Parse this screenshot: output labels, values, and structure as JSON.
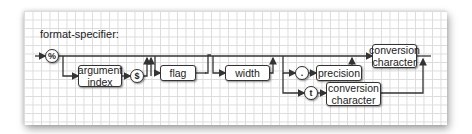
{
  "diagram": {
    "title": "format-specifier:",
    "terminals": {
      "percent": "%",
      "dollar": "$",
      "dot": ".",
      "t": "t"
    },
    "boxes": {
      "argument_index": "argument\nindex",
      "flag": "flag",
      "width": "width",
      "precision": "precision",
      "conversion_character_top": "conversion\ncharacter",
      "conversion_character_bottom": "conversion\ncharacter"
    },
    "colors": {
      "line": "#333333",
      "grid": "#dcdcdc",
      "paper": "#ffffff"
    }
  }
}
